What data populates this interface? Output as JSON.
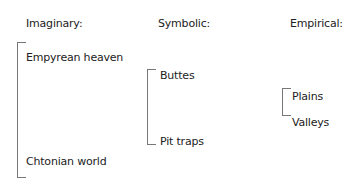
{
  "columns": [
    {
      "heading": "Imaginary:",
      "items": [
        "Empyrean heaven",
        "Chtonian world"
      ]
    },
    {
      "heading": "Symbolic:",
      "items": [
        "Buttes",
        "Pit traps"
      ]
    },
    {
      "heading": "Empirical:",
      "items": [
        "Plains",
        "Valleys"
      ]
    }
  ]
}
